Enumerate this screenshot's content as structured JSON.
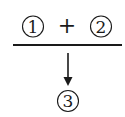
{
  "diagram": {
    "top": {
      "left_term": "1",
      "operator": "+",
      "right_term": "2"
    },
    "result": "3",
    "colors": {
      "ink": "#1a1a1a",
      "background": "#ffffff"
    }
  }
}
